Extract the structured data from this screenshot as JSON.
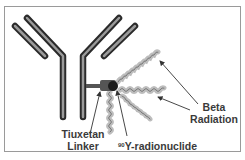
{
  "diagram": {
    "labels": {
      "beta_line1": "Beta",
      "beta_line2": "Radiation",
      "linker_line1": "Tiuxetan",
      "linker_line2": "Linker",
      "radionuclide_superscript": "90",
      "radionuclide_text": "Y-radionuclide"
    },
    "components": [
      "antibody",
      "tiuxetan-linker",
      "90Y-radionuclide",
      "beta-radiation"
    ],
    "colors": {
      "antibody_outer": "#2a2a2a",
      "antibody_inner": "#9a9a9a",
      "wave": "#c8c8c8",
      "text": "#3a3a3a",
      "frame": "#9a9a9a"
    }
  }
}
